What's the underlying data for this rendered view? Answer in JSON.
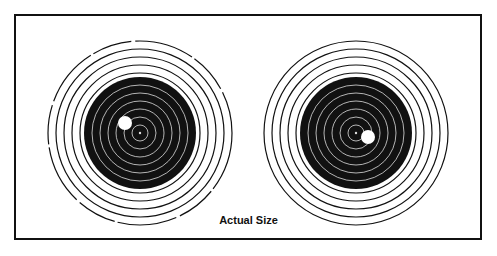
{
  "figure": {
    "caption": "Actual Size",
    "targets": [
      {
        "name": "left-target",
        "center": [
          140,
          133
        ],
        "hole": [
          125,
          123
        ]
      },
      {
        "name": "right-target",
        "center": [
          356,
          133
        ],
        "hole": [
          368,
          137
        ]
      }
    ],
    "colors": {
      "ink": "#111111",
      "paper": "#ffffff"
    }
  }
}
